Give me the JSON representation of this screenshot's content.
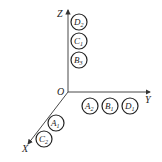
{
  "diagram": {
    "type": "3d-coordinate-axes-with-labeled-circles",
    "origin": {
      "label": "O"
    },
    "axes": {
      "x": {
        "label": "X"
      },
      "y": {
        "label": "Y"
      },
      "z": {
        "label": "Z"
      }
    },
    "z_axis_circles": [
      {
        "letter": "D",
        "sub": "2"
      },
      {
        "letter": "C",
        "sub": "1"
      },
      {
        "letter": "B",
        "sub": "3"
      }
    ],
    "y_axis_circles": [
      {
        "letter": "A",
        "sub": "2"
      },
      {
        "letter": "B",
        "sub": "1"
      },
      {
        "letter": "D",
        "sub": "1"
      }
    ],
    "x_axis_circles": [
      {
        "letter": "A",
        "sub": "1"
      },
      {
        "letter": "C",
        "sub": "2"
      }
    ],
    "colors": {
      "stroke": "#222222",
      "background": "#ffffff"
    }
  }
}
